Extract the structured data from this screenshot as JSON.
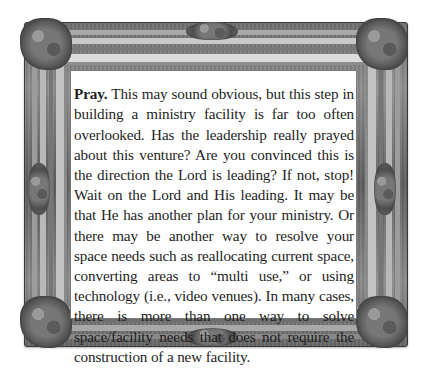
{
  "document": {
    "lead_word": "Pray.",
    "body": " This may sound obvious, but this step in building a ministry facility is far too often overlooked. Has the leadership really prayed about this venture? Are you convinced this is the direction the Lord is leading? If not, stop! Wait on the Lord and His leading. It may be that He has another plan for your ministry. Or there may be another way to resolve your space needs such as reallocating current space, converting areas to “multi use,” or using technology (i.e., video venues). In many cases, there is more than one way to solve space/facility needs that does not require the construction of a new facility."
  },
  "frame": {
    "style": "ornate-baroque-picture-frame",
    "color": "#7a7a7a",
    "panel_color": "#ffffff"
  }
}
